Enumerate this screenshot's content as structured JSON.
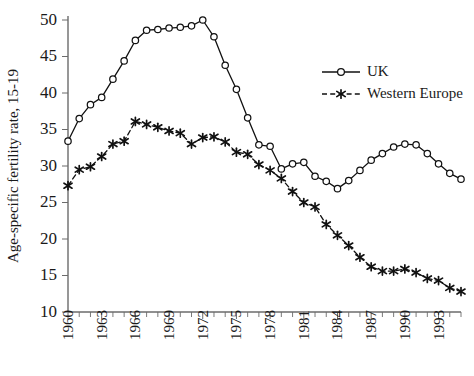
{
  "chart_data": {
    "type": "line",
    "title": "",
    "subtitle": "",
    "xlabel": "",
    "ylabel": "Age-specific fertility rate, 15-19",
    "xlim": [
      1960,
      1995
    ],
    "ylim": [
      10,
      50
    ],
    "ytick_step": 5,
    "grid": false,
    "legend_position": "top-right",
    "x_tick_label_step": 3,
    "x": [
      1960,
      1961,
      1962,
      1963,
      1964,
      1965,
      1966,
      1967,
      1968,
      1969,
      1970,
      1971,
      1972,
      1973,
      1974,
      1975,
      1976,
      1977,
      1978,
      1979,
      1980,
      1981,
      1982,
      1983,
      1984,
      1985,
      1986,
      1987,
      1988,
      1989,
      1990,
      1991,
      1992,
      1993,
      1994,
      1995
    ],
    "xticklabels": [
      "1960",
      "1963",
      "1966",
      "1969",
      "1972",
      "1975",
      "1978",
      "1981",
      "1984",
      "1987",
      "1990",
      "1993"
    ],
    "yticklabels": [
      "10",
      "15",
      "20",
      "25",
      "30",
      "35",
      "40",
      "45",
      "50"
    ],
    "series": [
      {
        "name": "UK",
        "marker": "open-circle",
        "linestyle": "solid",
        "color": "#111111",
        "values": [
          33.4,
          36.5,
          38.4,
          39.4,
          41.9,
          44.4,
          47.2,
          48.6,
          48.7,
          48.9,
          49.0,
          49.2,
          50.0,
          47.7,
          43.8,
          40.5,
          36.6,
          32.9,
          32.7,
          29.6,
          30.3,
          30.5,
          28.6,
          27.9,
          26.9,
          28.0,
          29.4,
          30.8,
          31.7,
          32.6,
          33.0,
          32.9,
          31.7,
          30.3,
          29.0,
          28.2
        ]
      },
      {
        "name": "Western Europe",
        "marker": "star",
        "linestyle": "dashed",
        "color": "#111111",
        "values": [
          27.3,
          29.5,
          29.9,
          31.3,
          33.0,
          33.4,
          36.1,
          35.7,
          35.3,
          34.8,
          34.5,
          33.0,
          33.9,
          34.0,
          33.3,
          31.9,
          31.6,
          30.2,
          29.4,
          28.3,
          26.5,
          25.0,
          24.4,
          22.0,
          20.5,
          19.1,
          17.5,
          16.2,
          15.6,
          15.6,
          15.9,
          15.4,
          14.6,
          14.3,
          13.3,
          12.8
        ]
      }
    ]
  },
  "legend": {
    "items": [
      {
        "label": "UK"
      },
      {
        "label": "Western Europe"
      }
    ]
  }
}
